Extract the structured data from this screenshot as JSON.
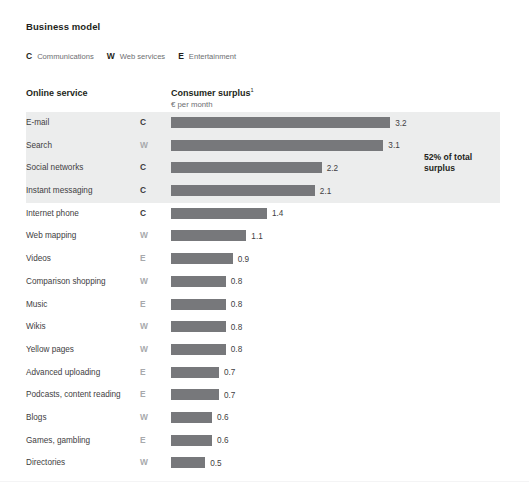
{
  "header": {
    "section_title": "Business model",
    "legend": [
      {
        "key": "C",
        "label": "Communications"
      },
      {
        "key": "W",
        "label": "Web services"
      },
      {
        "key": "E",
        "label": "Entertainment"
      }
    ]
  },
  "columns": {
    "service_header": "Online service",
    "surplus_header": "Consumer surplus",
    "surplus_footnote_marker": "1",
    "surplus_unit": "€ per month"
  },
  "annotation": {
    "text": "52% of total surplus"
  },
  "colors": {
    "bar": "#77787b",
    "highlight_band": "#eceded",
    "text": "#414042",
    "key_communications": "#3b3b3d",
    "key_other": "#a7a9ac"
  },
  "chart_data": {
    "type": "bar",
    "orientation": "horizontal",
    "title": "Business model",
    "xlabel": "Consumer surplus, € per month",
    "ylabel": "Online service",
    "xlim": [
      0,
      3.5
    ],
    "grid": false,
    "legend_position": "top-left",
    "categories": [
      "E-mail",
      "Search",
      "Social networks",
      "Instant messaging",
      "Internet phone",
      "Web mapping",
      "Videos",
      "Comparison shopping",
      "Music",
      "Wikis",
      "Yellow pages",
      "Advanced uploading",
      "Podcasts, content reading",
      "Blogs",
      "Games, gambling",
      "Directories"
    ],
    "values": [
      3.2,
      3.1,
      2.2,
      2.1,
      1.4,
      1.1,
      0.9,
      0.8,
      0.8,
      0.8,
      0.8,
      0.7,
      0.7,
      0.6,
      0.6,
      0.5
    ],
    "business_model": [
      "C",
      "W",
      "C",
      "C",
      "C",
      "W",
      "E",
      "W",
      "E",
      "W",
      "W",
      "E",
      "E",
      "W",
      "E",
      "W"
    ],
    "value_labels": [
      "3.2",
      "3.1",
      "2.2",
      "2.1",
      "1.4",
      "1.1",
      "0.9",
      "0.8",
      "0.8",
      "0.8",
      "0.8",
      "0.7",
      "0.7",
      "0.6",
      "0.6",
      "0.5"
    ],
    "highlighted_rows": [
      0,
      1,
      2,
      3
    ],
    "annotations": [
      {
        "text": "52% of total surplus",
        "applies_to_rows": [
          0,
          1,
          2,
          3
        ]
      }
    ]
  }
}
